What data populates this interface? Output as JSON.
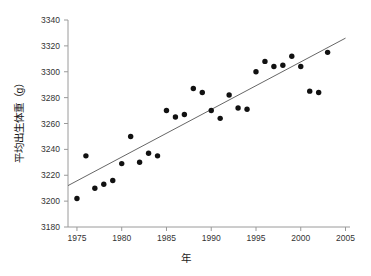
{
  "chart_data": {
    "type": "scatter",
    "title": "",
    "xlabel": "年",
    "ylabel": "平均出生体重（g）",
    "xlim": [
      1974,
      2005.5
    ],
    "ylim": [
      3180,
      3340
    ],
    "xticks": [
      1975,
      1980,
      1985,
      1990,
      1995,
      2000,
      2005
    ],
    "yticks": [
      3180,
      3200,
      3220,
      3240,
      3260,
      3280,
      3300,
      3320,
      3340
    ],
    "grid": false,
    "legend": null,
    "marker": {
      "shape": "circle",
      "color": "#111111",
      "size": 4.6
    },
    "x": [
      1975,
      1976,
      1977,
      1978,
      1979,
      1980,
      1981,
      1982,
      1983,
      1984,
      1985,
      1986,
      1987,
      1988,
      1989,
      1990,
      1991,
      1992,
      1993,
      1994,
      1995,
      1996,
      1997,
      1998,
      1999,
      2000,
      2001,
      2002,
      2003
    ],
    "values": [
      3202,
      3235,
      3210,
      3213,
      3216,
      3229,
      3250,
      3230,
      3237,
      3235,
      3270,
      3265,
      3267,
      3287,
      3284,
      3270,
      3264,
      3282,
      3272,
      3271,
      3300,
      3308,
      3304,
      3305,
      3312,
      3304,
      3285,
      3284,
      3315
    ],
    "series": [
      {
        "name": "平均出生体重",
        "points": [
          {
            "x": 1975,
            "y": 3202
          },
          {
            "x": 1976,
            "y": 3235
          },
          {
            "x": 1977,
            "y": 3210
          },
          {
            "x": 1978,
            "y": 3213
          },
          {
            "x": 1979,
            "y": 3216
          },
          {
            "x": 1980,
            "y": 3229
          },
          {
            "x": 1981,
            "y": 3250
          },
          {
            "x": 1982,
            "y": 3230
          },
          {
            "x": 1983,
            "y": 3237
          },
          {
            "x": 1984,
            "y": 3235
          },
          {
            "x": 1985,
            "y": 3270
          },
          {
            "x": 1986,
            "y": 3265
          },
          {
            "x": 1987,
            "y": 3267
          },
          {
            "x": 1988,
            "y": 3287
          },
          {
            "x": 1989,
            "y": 3284
          },
          {
            "x": 1990,
            "y": 3270
          },
          {
            "x": 1991,
            "y": 3264
          },
          {
            "x": 1992,
            "y": 3282
          },
          {
            "x": 1993,
            "y": 3272
          },
          {
            "x": 1994,
            "y": 3271
          },
          {
            "x": 1995,
            "y": 3300
          },
          {
            "x": 1996,
            "y": 3308
          },
          {
            "x": 1997,
            "y": 3304
          },
          {
            "x": 1998,
            "y": 3305
          },
          {
            "x": 1999,
            "y": 3312
          },
          {
            "x": 2000,
            "y": 3304
          },
          {
            "x": 2001,
            "y": 3285
          },
          {
            "x": 2002,
            "y": 3284
          },
          {
            "x": 2003,
            "y": 3315
          }
        ]
      }
    ],
    "trendline": {
      "type": "linear",
      "color": "#555555",
      "x_start": 1974,
      "y_start": 3212,
      "x_end": 2005,
      "y_end": 3326
    },
    "axis_color": "#9a9a9a",
    "background": "#ffffff"
  }
}
